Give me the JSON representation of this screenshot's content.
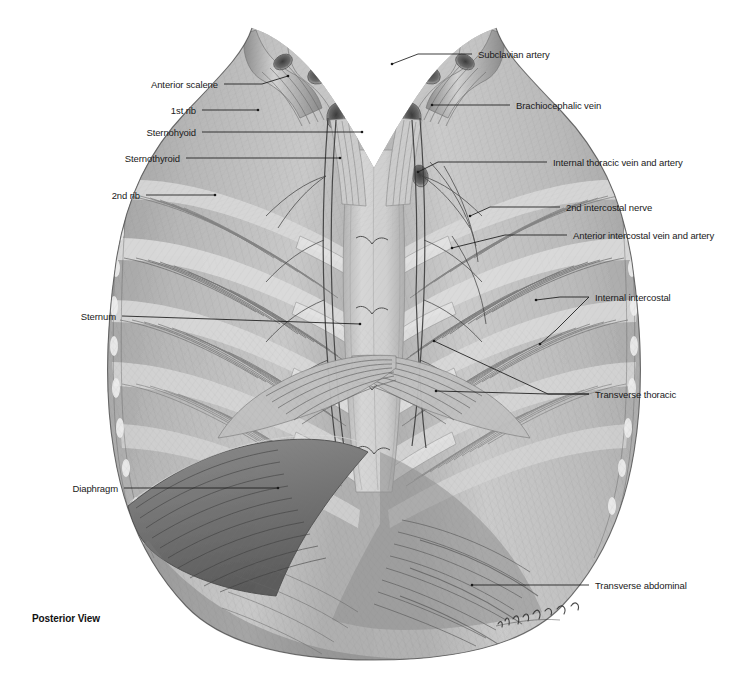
{
  "figure": {
    "title_caption": "Posterior View",
    "artist_signature": "T. Chubb",
    "background_color": "#ffffff",
    "ink_color": "#1a1a1a",
    "tone_light": "#d9d9d9",
    "tone_mid": "#a8a8a8",
    "tone_dark": "#6d6d6d",
    "tone_darkest": "#3f3f3f"
  },
  "labels": {
    "left": [
      {
        "name": "anterior-scalene",
        "text": "Anterior scalene",
        "text_x": 218,
        "text_y": 84,
        "leader": [
          [
            224,
            84
          ],
          [
            262,
            84
          ],
          [
            288,
            76
          ]
        ]
      },
      {
        "name": "first-rib",
        "text": "1st rib",
        "text_x": 196,
        "text_y": 110,
        "leader": [
          [
            202,
            110
          ],
          [
            258,
            110
          ]
        ]
      },
      {
        "name": "sternohyoid",
        "text": "Sternohyoid",
        "text_x": 196,
        "text_y": 132,
        "leader": [
          [
            202,
            132
          ],
          [
            362,
            132
          ]
        ]
      },
      {
        "name": "sternothyroid",
        "text": "Sternothyroid",
        "text_x": 180,
        "text_y": 158,
        "leader": [
          [
            186,
            158
          ],
          [
            340,
            158
          ]
        ]
      },
      {
        "name": "second-rib",
        "text": "2nd rib",
        "text_x": 140,
        "text_y": 195,
        "leader": [
          [
            146,
            195
          ],
          [
            215,
            195
          ]
        ]
      },
      {
        "name": "sternum",
        "text": "Sternum",
        "text_x": 116,
        "text_y": 316,
        "leader": [
          [
            122,
            316
          ],
          [
            360,
            324
          ]
        ]
      },
      {
        "name": "diaphragm",
        "text": "Diaphragm",
        "text_x": 118,
        "text_y": 488,
        "leader": [
          [
            124,
            488
          ],
          [
            278,
            488
          ]
        ]
      }
    ],
    "right": [
      {
        "name": "subclavian-artery",
        "text": "Subclavian artery",
        "text_x": 478,
        "text_y": 54,
        "leader": [
          [
            472,
            54
          ],
          [
            418,
            54
          ],
          [
            392,
            64
          ]
        ]
      },
      {
        "name": "brachiocephalic-vein",
        "text": "Brachiocephalic vein",
        "text_x": 516,
        "text_y": 105,
        "leader": [
          [
            510,
            105
          ],
          [
            432,
            105
          ]
        ]
      },
      {
        "name": "internal-thoracic-vein-artery",
        "text": "Internal thoracic vein and artery",
        "text_x": 553,
        "text_y": 162,
        "leader": [
          [
            547,
            162
          ],
          [
            438,
            162
          ],
          [
            418,
            172
          ]
        ]
      },
      {
        "name": "second-intercostal-nerve",
        "text": "2nd intercostal nerve",
        "text_x": 566,
        "text_y": 207,
        "leader": [
          [
            560,
            207
          ],
          [
            490,
            207
          ],
          [
            470,
            216
          ]
        ]
      },
      {
        "name": "anterior-intercostal-vein-artery",
        "text": "Anterior intercostal vein and artery",
        "text_x": 573,
        "text_y": 235,
        "leader": [
          [
            567,
            235
          ],
          [
            505,
            235
          ],
          [
            452,
            248
          ]
        ]
      },
      {
        "name": "internal-intercostal",
        "text": "Internal intercostal",
        "text_x": 595,
        "text_y": 297,
        "leader_fork": [
          [
            [
              589,
              297
            ],
            [
              560,
              297
            ],
            [
              536,
              300
            ]
          ],
          [
            [
              589,
              297
            ],
            [
              556,
              330
            ],
            [
              540,
              344
            ]
          ]
        ]
      },
      {
        "name": "transverse-thoracic",
        "text": "Transverse thoracic",
        "text_x": 595,
        "text_y": 394,
        "leader_fork": [
          [
            [
              589,
              394
            ],
            [
              548,
              394
            ],
            [
              434,
              341
            ]
          ],
          [
            [
              589,
              394
            ],
            [
              548,
              394
            ],
            [
              436,
              391
            ]
          ]
        ]
      },
      {
        "name": "transverse-abdominal",
        "text": "Transverse abdominal",
        "text_x": 595,
        "text_y": 585,
        "leader": [
          [
            589,
            585
          ],
          [
            472,
            585
          ]
        ]
      }
    ]
  },
  "caption": {
    "text": "Posterior View",
    "x": 32,
    "y": 613
  }
}
